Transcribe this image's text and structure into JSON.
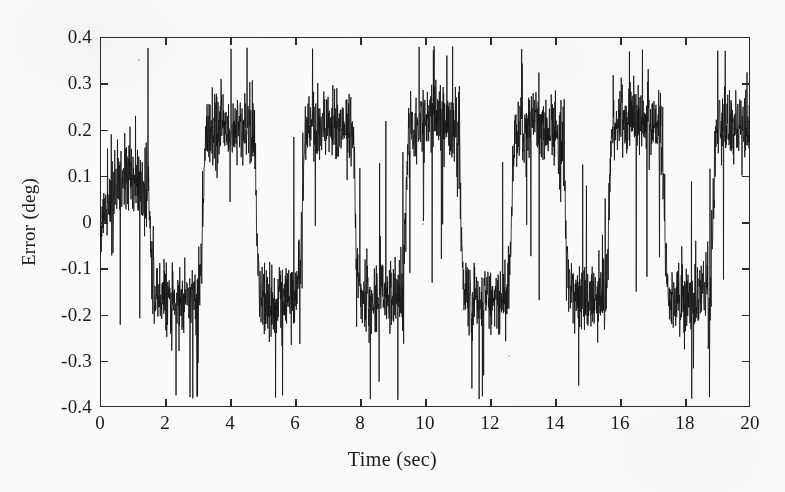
{
  "figure": {
    "background_color": "#fbfaf8",
    "line_color": "#151515",
    "axis_color": "#2b2b2b"
  },
  "axes": {
    "x_title": "Time (sec)",
    "y_title": "Error (deg)",
    "x_ticks": [
      "0",
      "2",
      "4",
      "6",
      "8",
      "10",
      "12",
      "14",
      "16",
      "18",
      "20"
    ],
    "y_ticks": [
      "0.4",
      "0.3",
      "0.2",
      "0.1",
      "0",
      "-0.1",
      "-0.2",
      "-0.3",
      "-0.4"
    ]
  },
  "chart_data": {
    "type": "line",
    "title": "",
    "subtitle": "",
    "xlabel": "Time (sec)",
    "ylabel": "Error (deg)",
    "xlim": [
      0,
      20
    ],
    "ylim": [
      -0.4,
      0.4
    ],
    "xticks": [
      0,
      2,
      4,
      6,
      8,
      10,
      12,
      14,
      16,
      18,
      20
    ],
    "yticks": [
      -0.4,
      -0.3,
      -0.2,
      -0.1,
      0,
      0.1,
      0.2,
      0.3,
      0.4
    ],
    "grid": false,
    "legend": null,
    "legend_position": "none",
    "annotations": [],
    "series": [
      {
        "name": "Tracking error",
        "description": "Noisy square-wave tracking error: alternating plateaus near +0.18 deg and -0.15 deg with dense high-frequency measurement noise; individual spikes reach about +0.37 and -0.38 deg.",
        "waveform": "square",
        "period_sec": 3.3,
        "first_positive_plateau": [
          0.35,
          1.45
        ],
        "high_level": 0.18,
        "low_level": -0.15,
        "noise_band_high": 0.09,
        "noise_band_low": 0.09,
        "spike_max": 0.38,
        "spike_min": -0.385,
        "start_value": 0.0,
        "sample_count": 2600,
        "plateau_segments": [
          {
            "t_start": 0.0,
            "t_end": 0.35,
            "level": 0.02,
            "kind": "ramp-up"
          },
          {
            "t_start": 0.35,
            "t_end": 1.45,
            "level": 0.08,
            "kind": "high"
          },
          {
            "t_start": 1.45,
            "t_end": 3.05,
            "level": -0.15,
            "kind": "low"
          },
          {
            "t_start": 3.05,
            "t_end": 4.7,
            "level": 0.19,
            "kind": "high"
          },
          {
            "t_start": 4.7,
            "t_end": 6.1,
            "level": -0.15,
            "kind": "low"
          },
          {
            "t_start": 6.1,
            "t_end": 7.75,
            "level": 0.19,
            "kind": "high"
          },
          {
            "t_start": 7.75,
            "t_end": 9.3,
            "level": -0.15,
            "kind": "low"
          },
          {
            "t_start": 9.3,
            "t_end": 11.0,
            "level": 0.2,
            "kind": "high"
          },
          {
            "t_start": 11.0,
            "t_end": 12.55,
            "level": -0.15,
            "kind": "low"
          },
          {
            "t_start": 12.55,
            "t_end": 14.2,
            "level": 0.19,
            "kind": "high"
          },
          {
            "t_start": 14.2,
            "t_end": 15.55,
            "level": -0.15,
            "kind": "low"
          },
          {
            "t_start": 15.55,
            "t_end": 17.25,
            "level": 0.2,
            "kind": "high"
          },
          {
            "t_start": 17.25,
            "t_end": 18.75,
            "level": -0.15,
            "kind": "low"
          },
          {
            "t_start": 18.75,
            "t_end": 20.0,
            "level": 0.19,
            "kind": "high"
          }
        ]
      }
    ]
  }
}
